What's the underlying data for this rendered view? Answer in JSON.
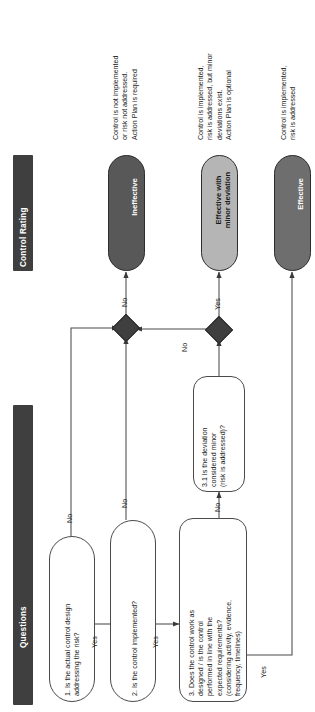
{
  "page": {
    "width": 315,
    "height": 712,
    "background": "#ffffff",
    "orientation": "rotated-90-ccw"
  },
  "colors": {
    "band": "#3f3f3f",
    "band_text": "#ffffff",
    "ineffective": "#585858",
    "effective_minor": "#b5b5b5",
    "effective": "#6e6e6e",
    "line": "#4a4a4a",
    "diamond": "#3f3f3f",
    "text": "#1a1a1a"
  },
  "bands": [
    {
      "id": "control-rating",
      "label": "Control Rating"
    },
    {
      "id": "questions",
      "label": "Questions"
    }
  ],
  "ratings": [
    {
      "id": "ineffective",
      "label": "Ineffective",
      "fill": "#585858",
      "text_color": "#ffffff",
      "note": "Control is not implemented\nor risk not addressed.\nAction Plan is required"
    },
    {
      "id": "effective-with-minor-deviation",
      "label": "Effective with\nminor deviation",
      "fill": "#b5b5b5",
      "text_color": "#1a1a1a",
      "note": "Control is implemented,\nrisk is addressed, but minor\ndeviations exist.\nAction Plan is optional"
    },
    {
      "id": "effective",
      "label": "Effective",
      "fill": "#6e6e6e",
      "text_color": "#ffffff",
      "note": "Control is implemented,\nrisk is addressed"
    }
  ],
  "questions": [
    {
      "id": "q1",
      "label": "1. Is the actual control design\naddressing the risk?",
      "yes": "Yes",
      "no": "No"
    },
    {
      "id": "q2",
      "label": "2. Is the control implemented?",
      "yes": "Yes",
      "no": "No"
    },
    {
      "id": "q3",
      "label": "3. Does the control work as\ndesigned / is the control\nperformed in line with the\nexpected requirements?\n(considering activity, evidence,\nfrequency, timelines)",
      "yes": "Yes",
      "no": "No"
    },
    {
      "id": "q3-1",
      "label": "3.1 Is the deviation\nconsidered minor\n(risk is addressed)?",
      "yes": "Yes",
      "no": "No"
    }
  ],
  "edge_labels": {
    "merge_to_ineffective": "No",
    "diamond2_no": "No",
    "diamond2_to_minor": "Yes",
    "q31_yes_to_effective": "Yes"
  },
  "junctions": [
    {
      "id": "merge-junction-ineffective",
      "shape": "diamond"
    },
    {
      "id": "merge-junction-deviation",
      "shape": "diamond"
    }
  ]
}
